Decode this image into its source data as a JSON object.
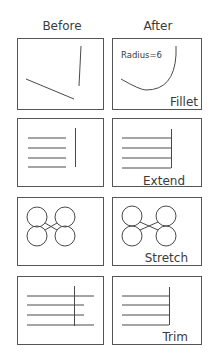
{
  "headers": {
    "before": "Before",
    "after": "After"
  },
  "rows": [
    {
      "name": "fillet",
      "label": "Fillet",
      "annotation": "Radius=6"
    },
    {
      "name": "extend",
      "label": "Extend",
      "annotation": ""
    },
    {
      "name": "stretch",
      "label": "Stretch",
      "annotation": ""
    },
    {
      "name": "trim",
      "label": "Trim",
      "annotation": ""
    }
  ],
  "colors": {
    "line": "#4a4a4a",
    "text": "#3a3a3a",
    "background": "#ffffff"
  }
}
